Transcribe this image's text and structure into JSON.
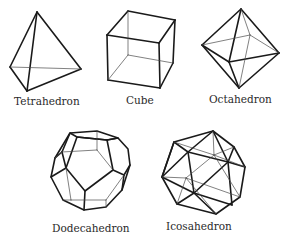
{
  "figure": {
    "solids": [
      {
        "id": "tetrahedron",
        "label": "Tetrahedron",
        "faces": 4
      },
      {
        "id": "cube",
        "label": "Cube",
        "faces": 6
      },
      {
        "id": "octahedron",
        "label": "Octahedron",
        "faces": 8
      },
      {
        "id": "dodecahedron",
        "label": "Dodecahedron",
        "faces": 12
      },
      {
        "id": "icosahedron",
        "label": "Icosahedron",
        "faces": 20
      }
    ]
  },
  "colors": {
    "line": "#1a1a1a",
    "hidden_line": "#4a4a4a",
    "text": "#2a2a2a",
    "background": "#ffffff"
  }
}
